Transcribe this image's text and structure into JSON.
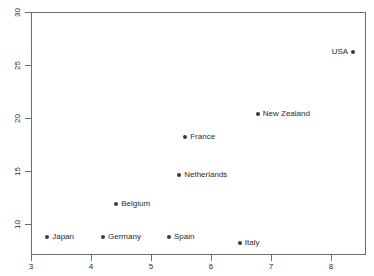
{
  "chart_data": {
    "type": "scatter",
    "title": "",
    "subtitle": "",
    "xlabel": "",
    "ylabel": "",
    "xlim": [
      3,
      8.6
    ],
    "ylim": [
      7.6,
      30
    ],
    "grid": false,
    "legend": "none",
    "xticks": [
      "3",
      "4",
      "5",
      "6",
      "7",
      "8"
    ],
    "xtick_values": [
      3,
      4,
      5,
      6,
      7,
      8
    ],
    "yticks": [
      "10",
      "15",
      "20",
      "25",
      "30"
    ],
    "ytick_values": [
      10,
      15,
      20,
      25,
      30
    ],
    "point_color": "#3a3a3a",
    "frame_color": "#6d6d6d",
    "background_color": "#ffffff",
    "points": [
      {
        "label": "USA",
        "x": 8.37,
        "y": 26.2,
        "label_side": "left"
      },
      {
        "label": "New Zealand",
        "x": 6.78,
        "y": 20.4,
        "label_side": "right"
      },
      {
        "label": "France",
        "x": 5.57,
        "y": 18.2,
        "label_side": "right"
      },
      {
        "label": "Netherlands",
        "x": 5.47,
        "y": 14.6,
        "label_side": "right"
      },
      {
        "label": "Belgium",
        "x": 4.42,
        "y": 11.9,
        "label_side": "right"
      },
      {
        "label": "Spain",
        "x": 5.3,
        "y": 8.8,
        "label_side": "right"
      },
      {
        "label": "Germany",
        "x": 4.2,
        "y": 8.8,
        "label_side": "right"
      },
      {
        "label": "Japan",
        "x": 3.27,
        "y": 8.8,
        "label_side": "right"
      },
      {
        "label": "Italy",
        "x": 6.48,
        "y": 8.2,
        "label_side": "right"
      }
    ]
  }
}
